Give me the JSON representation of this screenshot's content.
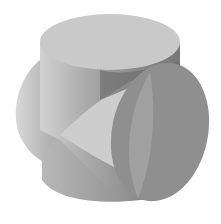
{
  "figure": {
    "colors": {
      "background": "#ffffff",
      "top_face": "#c8c8c8",
      "left_light": "#d0d0d0",
      "left_mid": "#b4b4b4",
      "body_mid": "#9c9c9c",
      "body_dark": "#7a7a7a",
      "right_disk": "#8e8e8e",
      "wedge_light": "#cfcfcf",
      "shadow": "#6a6a6a"
    }
  }
}
